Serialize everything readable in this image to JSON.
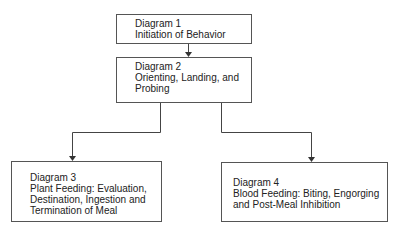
{
  "diagram": {
    "boxes": [
      {
        "id": "d1",
        "title": "Diagram 1",
        "lines": [
          "Initiation of Behavior"
        ]
      },
      {
        "id": "d2",
        "title": "Diagram 2",
        "lines": [
          "Orienting, Landing, and",
          "Probing"
        ]
      },
      {
        "id": "d3",
        "title": "Diagram 3",
        "lines": [
          "Plant Feeding:  Evaluation,",
          "Destination, Ingestion and",
          "Termination of Meal"
        ]
      },
      {
        "id": "d4",
        "title": "Diagram 4",
        "lines": [
          "Blood Feeding:  Biting, Engorging",
          "and Post-Meal Inhibition"
        ]
      }
    ],
    "edges": [
      {
        "from": "d1",
        "to": "d2"
      },
      {
        "from": "d2",
        "to": "d3"
      },
      {
        "from": "d2",
        "to": "d4"
      }
    ]
  }
}
